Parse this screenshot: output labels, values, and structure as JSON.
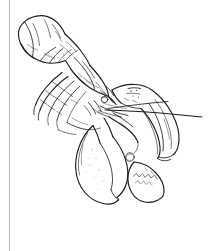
{
  "document": {
    "kind": "line-art-illustration",
    "subject": "lobster",
    "medium": "pen and ink drawing",
    "caption": "",
    "paper_color": "#ffffff",
    "ink_color": "#1d1d1d",
    "rule_color": "#b9bcbe",
    "canvas": {
      "width": 219,
      "height": 251
    }
  },
  "margin_rule": {
    "label": "left margin rule",
    "x": 9,
    "top": 0,
    "bottom": 251,
    "color": "#b9bcbe"
  },
  "figure": {
    "orientation": "diagonal, head lower-right, tail upper-left",
    "parts": [
      {
        "name": "tail-fan",
        "label": "Tail fan (telson and uropods)"
      },
      {
        "name": "abdomen",
        "label": "Abdomen segments"
      },
      {
        "name": "carapace",
        "label": "Carapace"
      },
      {
        "name": "rostrum",
        "label": "Rostrum"
      },
      {
        "name": "eye",
        "label": "Eye"
      },
      {
        "name": "antenna-long",
        "label": "Long antenna"
      },
      {
        "name": "antennule",
        "label": "Antennule"
      },
      {
        "name": "crusher-claw",
        "label": "Crusher claw (lower left)"
      },
      {
        "name": "pincer-claw",
        "label": "Pincer claw (upper right)"
      },
      {
        "name": "claw-dactyl",
        "label": "Movable claw finger"
      },
      {
        "name": "walking-legs",
        "label": "Walking legs"
      },
      {
        "name": "swimmerets",
        "label": "Swimmerets"
      }
    ]
  }
}
